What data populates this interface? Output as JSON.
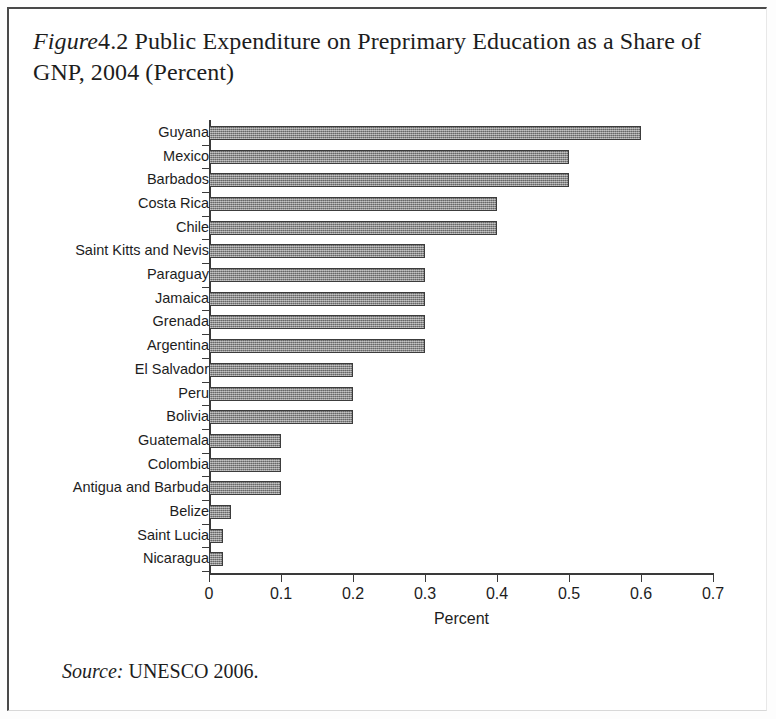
{
  "figure": {
    "label_italic": "Figure",
    "number_and_title": "4.2 Public Expenditure on Preprimary Education as a Share of GNP, 2004 (Percent)",
    "source_label": "Source:",
    "source_text": "UNESCO 2006."
  },
  "chart_data": {
    "type": "bar",
    "orientation": "horizontal",
    "xlabel": "Percent",
    "ylabel": "",
    "xlim": [
      0,
      0.7
    ],
    "xticks": [
      0,
      0.1,
      0.2,
      0.3,
      0.4,
      0.5,
      0.6,
      0.7
    ],
    "xtick_labels": [
      "0",
      "0.1",
      "0.2",
      "0.3",
      "0.4",
      "0.5",
      "0.6",
      "0.7"
    ],
    "grid": false,
    "legend": null,
    "bar_color": "#8c8c8c",
    "bar_edge_color": "#3c3c3c",
    "categories": [
      "Guyana",
      "Mexico",
      "Barbados",
      "Costa Rica",
      "Chile",
      "Saint Kitts and Nevis",
      "Paraguay",
      "Jamaica",
      "Grenada",
      "Argentina",
      "El Salvador",
      "Peru",
      "Bolivia",
      "Guatemala",
      "Colombia",
      "Antigua and Barbuda",
      "Belize",
      "Saint Lucia",
      "Nicaragua"
    ],
    "values": [
      0.6,
      0.5,
      0.5,
      0.4,
      0.4,
      0.3,
      0.3,
      0.3,
      0.3,
      0.3,
      0.2,
      0.2,
      0.2,
      0.1,
      0.1,
      0.1,
      0.03,
      0.02,
      0.02
    ]
  }
}
